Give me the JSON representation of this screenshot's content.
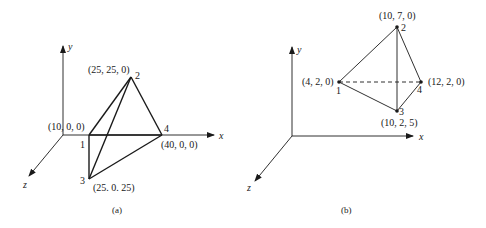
{
  "figure_a": {
    "caption": "(a)",
    "axes": {
      "x": "x",
      "y": "y",
      "z": "z"
    },
    "origin_label": "(10, 0, 0)",
    "nodes": [
      {
        "id": "1",
        "coords": "(10, 0, 0)"
      },
      {
        "id": "2",
        "coords": "(25, 25, 0)"
      },
      {
        "id": "3",
        "coords": "(25. 0. 25)"
      },
      {
        "id": "4",
        "coords": "(40, 0, 0)"
      }
    ],
    "edges": [
      [
        "1",
        "2"
      ],
      [
        "2",
        "4"
      ],
      [
        "2",
        "3"
      ],
      [
        "1",
        "3"
      ],
      [
        "3",
        "4"
      ],
      [
        "1",
        "4"
      ]
    ]
  },
  "figure_b": {
    "caption": "(b)",
    "axes": {
      "x": "x",
      "y": "y",
      "z": "z"
    },
    "nodes": [
      {
        "id": "1",
        "coords": "(4, 2, 0)"
      },
      {
        "id": "2",
        "coords": "(10, 7, 0)"
      },
      {
        "id": "3",
        "coords": "(10, 2, 5)"
      },
      {
        "id": "4",
        "coords": "(12, 2, 0)"
      }
    ],
    "edges": [
      [
        "1",
        "2"
      ],
      [
        "2",
        "4"
      ],
      [
        "2",
        "3"
      ],
      [
        "1",
        "3"
      ],
      [
        "3",
        "4"
      ]
    ],
    "hidden_edges": [
      [
        "1",
        "4"
      ]
    ]
  }
}
